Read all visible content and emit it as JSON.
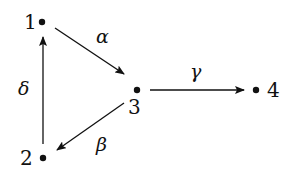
{
  "diagram": {
    "type": "directed-graph",
    "nodes": [
      {
        "id": "1",
        "label": "1",
        "x": 42,
        "y": 22
      },
      {
        "id": "2",
        "label": "2",
        "x": 43,
        "y": 158
      },
      {
        "id": "3",
        "label": "3",
        "x": 137,
        "y": 90
      },
      {
        "id": "4",
        "label": "4",
        "x": 256,
        "y": 90
      }
    ],
    "edges": [
      {
        "from": "1",
        "to": "3",
        "label": "α"
      },
      {
        "from": "3",
        "to": "2",
        "label": "β"
      },
      {
        "from": "3",
        "to": "4",
        "label": "γ"
      },
      {
        "from": "2",
        "to": "1",
        "label": "δ"
      }
    ],
    "color": "#111111"
  }
}
